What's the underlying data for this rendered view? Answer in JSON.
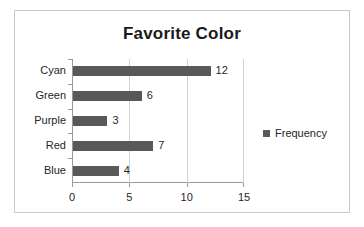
{
  "chart_data": {
    "type": "bar",
    "orientation": "horizontal",
    "title": "Favorite Color",
    "categories": [
      "Blue",
      "Red",
      "Purple",
      "Green",
      "Cyan"
    ],
    "values": [
      4,
      7,
      3,
      6,
      12
    ],
    "data_labels": [
      "4",
      "7",
      "3",
      "6",
      "12"
    ],
    "series": [
      {
        "name": "Frequency",
        "values": [
          4,
          7,
          3,
          6,
          12
        ],
        "color": "#595959"
      }
    ],
    "xlabel": "",
    "ylabel": "",
    "xlim": [
      0,
      15
    ],
    "xticks": [
      0,
      5,
      10,
      15
    ],
    "xtick_labels": [
      "0",
      "5",
      "10",
      "15"
    ],
    "gridlines": [
      5,
      10
    ],
    "grid": true,
    "legend": {
      "position": "right",
      "entries": [
        "Frequency"
      ]
    }
  },
  "legend": {
    "label": "Frequency"
  },
  "axis": {
    "x_tick_labels": [
      "0",
      "5",
      "10",
      "15"
    ]
  },
  "colors": {
    "bar": "#595959",
    "border": "#c9c9c9",
    "axis": "#9a9a9a",
    "grid": "#d0d0d0",
    "text": "#262626",
    "title": "#1a1a1a"
  }
}
